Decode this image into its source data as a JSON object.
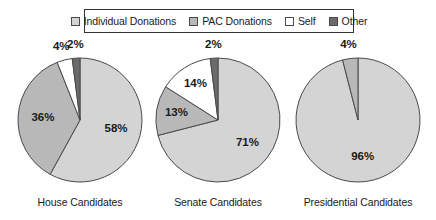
{
  "legend": {
    "items": [
      {
        "label": "Individual Donations",
        "color": "#d4d4d4",
        "key": "individual"
      },
      {
        "label": "PAC Donations",
        "color": "#b8b8b8",
        "key": "pac"
      },
      {
        "label": "Self",
        "color": "#ffffff",
        "key": "self"
      },
      {
        "label": "Other",
        "color": "#6b6b6b",
        "key": "other"
      }
    ]
  },
  "chart_data": {
    "type": "pie",
    "title": "",
    "legend_position": "top",
    "categories": [
      "Individual Donations",
      "PAC Donations",
      "Self",
      "Other"
    ],
    "colors": [
      "#d4d4d4",
      "#b8b8b8",
      "#ffffff",
      "#6b6b6b"
    ],
    "units": "percent",
    "charts": [
      {
        "name": "House Candidates",
        "slices": [
          {
            "category": "Individual Donations",
            "value": 58,
            "label": "58%"
          },
          {
            "category": "PAC Donations",
            "value": 36,
            "label": "36%"
          },
          {
            "category": "Self",
            "value": 4,
            "label": "4%"
          },
          {
            "category": "Other",
            "value": 2,
            "label": "2%"
          }
        ]
      },
      {
        "name": "Senate Candidates",
        "slices": [
          {
            "category": "Individual Donations",
            "value": 71,
            "label": "71%"
          },
          {
            "category": "PAC Donations",
            "value": 13,
            "label": "13%"
          },
          {
            "category": "Self",
            "value": 14,
            "label": "14%"
          },
          {
            "category": "Other",
            "value": 2,
            "label": "2%"
          }
        ]
      },
      {
        "name": "Presidential Candidates",
        "slices": [
          {
            "category": "Individual Donations",
            "value": 96,
            "label": "96%"
          },
          {
            "category": "PAC Donations",
            "value": 4,
            "label": "4%"
          }
        ]
      }
    ]
  },
  "captions": {
    "house": "House Candidates",
    "senate": "Senate Candidates",
    "presidential": "Presidential Candidates"
  }
}
